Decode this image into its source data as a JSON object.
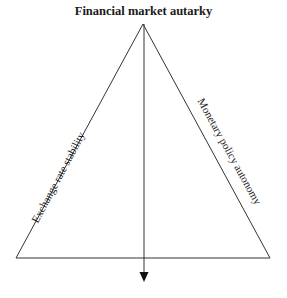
{
  "diagram": {
    "title": "Financial market autarky",
    "edges": {
      "left": "Exchange rate stability",
      "right": "Monetary policy autonomy"
    },
    "vertices": {
      "top": "Financial market autarky"
    },
    "colors": {
      "line": "#333333",
      "text": "#1a1a1a",
      "background": "#ffffff"
    },
    "geometry": {
      "apex": [
        143,
        24
      ],
      "base_left": [
        16,
        258
      ],
      "base_right": [
        270,
        258
      ],
      "arrow": {
        "x": 144,
        "from_y": 24,
        "to_y": 281
      }
    }
  }
}
